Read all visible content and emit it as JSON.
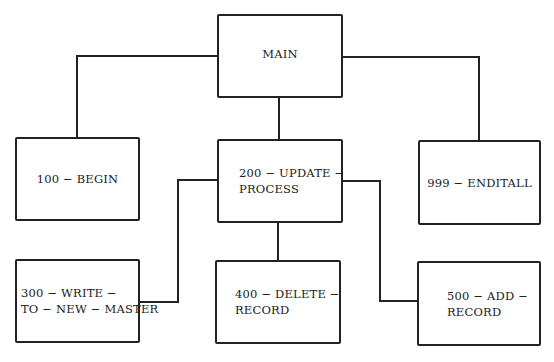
{
  "diagram": {
    "type": "hierarchy-chart",
    "nodes": [
      {
        "id": "main",
        "label": "MAIN"
      },
      {
        "id": "100",
        "label": "100 − BEGIN"
      },
      {
        "id": "200",
        "label": "200 − UPDATE −\nPROCESS"
      },
      {
        "id": "999",
        "label": "999 − ENDITALL"
      },
      {
        "id": "300",
        "label": "300 − WRITE −\nTO − NEW − MASTER"
      },
      {
        "id": "400",
        "label": "400 − DELETE −\nRECORD"
      },
      {
        "id": "500",
        "label": "500 − ADD −\nRECORD"
      }
    ],
    "edges": [
      {
        "from": "main",
        "to": "100"
      },
      {
        "from": "main",
        "to": "200"
      },
      {
        "from": "main",
        "to": "999"
      },
      {
        "from": "200",
        "to": "300"
      },
      {
        "from": "200",
        "to": "400"
      },
      {
        "from": "200",
        "to": "500"
      }
    ]
  }
}
